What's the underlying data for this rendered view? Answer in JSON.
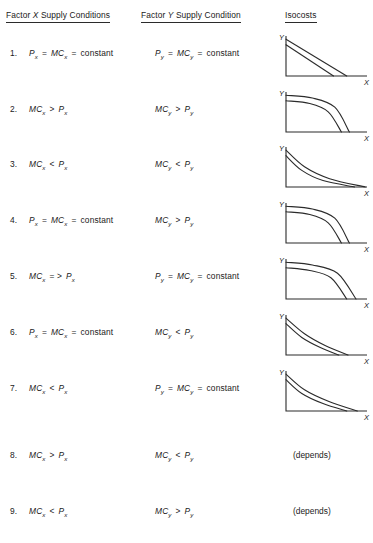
{
  "header": {
    "col_x": {
      "prefix": "Factor ",
      "var": "X",
      "suffix": " Supply Conditions"
    },
    "col_y": {
      "prefix": "Factor ",
      "var": "Y",
      "suffix": " Supply Condition"
    },
    "col_iso": "Isocosts"
  },
  "rows": [
    {
      "num": "1.",
      "x": {
        "lhs_sym": "P",
        "lhs_sub": "x",
        "op1": "=",
        "mid_sym": "MC",
        "mid_sub": "x",
        "op2": "=",
        "rhs": "constant"
      },
      "y": {
        "lhs_sym": "P",
        "lhs_sub": "y",
        "op1": "=",
        "mid_sym": "MC",
        "mid_sub": "y",
        "op2": "=",
        "rhs": "constant"
      },
      "iso": {
        "kind": "chart",
        "shape": "straight",
        "ylabel": "Y",
        "xlabel": "X"
      }
    },
    {
      "num": "2.",
      "x": {
        "lhs_sym": "MC",
        "lhs_sub": "x",
        "op1": ">",
        "mid_sym": "P",
        "mid_sub": "x"
      },
      "y": {
        "lhs_sym": "MC",
        "lhs_sub": "y",
        "op1": ">",
        "mid_sym": "P",
        "mid_sub": "y"
      },
      "iso": {
        "kind": "chart",
        "shape": "concave",
        "ylabel": "Y",
        "xlabel": "X"
      }
    },
    {
      "num": "3.",
      "x": {
        "lhs_sym": "MC",
        "lhs_sub": "x",
        "op1": "<",
        "mid_sym": "P",
        "mid_sub": "x"
      },
      "y": {
        "lhs_sym": "MC",
        "lhs_sub": "y",
        "op1": "<",
        "mid_sym": "P",
        "mid_sub": "y"
      },
      "iso": {
        "kind": "chart",
        "shape": "convex",
        "ylabel": "Y",
        "xlabel": "X"
      }
    },
    {
      "num": "4.",
      "x": {
        "lhs_sym": "P",
        "lhs_sub": "x",
        "op1": "=",
        "mid_sym": "MC",
        "mid_sub": "x",
        "op2": "=",
        "rhs": "constant"
      },
      "y": {
        "lhs_sym": "MC",
        "lhs_sub": "y",
        "op1": ">",
        "mid_sym": "P",
        "mid_sub": "y"
      },
      "iso": {
        "kind": "chart",
        "shape": "concave",
        "ylabel": "Y",
        "xlabel": "X"
      }
    },
    {
      "num": "5.",
      "x": {
        "lhs_sym": "MC",
        "lhs_sub": "x",
        "op1": "= >",
        "mid_sym": "P",
        "mid_sub": "x"
      },
      "y": {
        "lhs_sym": "P",
        "lhs_sub": "y",
        "op1": "=",
        "mid_sym": "MC",
        "mid_sub": "y",
        "op2": "=",
        "rhs": "constant"
      },
      "iso": {
        "kind": "chart",
        "shape": "concave",
        "ylabel": "Y",
        "xlabel": "X"
      }
    },
    {
      "num": "6.",
      "x": {
        "lhs_sym": "P",
        "lhs_sub": "x",
        "op1": "=",
        "mid_sym": "MC",
        "mid_sub": "x",
        "op2": "=",
        "rhs": "constant"
      },
      "y": {
        "lhs_sym": "MC",
        "lhs_sub": "y",
        "op1": "<",
        "mid_sym": "P",
        "mid_sub": "y"
      },
      "iso": {
        "kind": "chart",
        "shape": "convex",
        "ylabel": "Y",
        "xlabel": "X"
      }
    },
    {
      "num": "7.",
      "x": {
        "lhs_sym": "MC",
        "lhs_sub": "x",
        "op1": "<",
        "mid_sym": "P",
        "mid_sub": "x"
      },
      "y": {
        "lhs_sym": "P",
        "lhs_sub": "y",
        "op1": "=",
        "mid_sym": "MC",
        "mid_sub": "y",
        "op2": "=",
        "rhs": "constant"
      },
      "iso": {
        "kind": "chart",
        "shape": "convex",
        "ylabel": "Y",
        "xlabel": "X"
      }
    },
    {
      "num": "8.",
      "x": {
        "lhs_sym": "MC",
        "lhs_sub": "x",
        "op1": ">",
        "mid_sym": "P",
        "mid_sub": "x"
      },
      "y": {
        "lhs_sym": "MC",
        "lhs_sub": "y",
        "op1": "<",
        "mid_sym": "P",
        "mid_sub": "y"
      },
      "iso": {
        "kind": "text",
        "text": "(depends)"
      }
    },
    {
      "num": "9.",
      "x": {
        "lhs_sym": "MC",
        "lhs_sub": "x",
        "op1": "<",
        "mid_sym": "P",
        "mid_sub": "x"
      },
      "y": {
        "lhs_sym": "MC",
        "lhs_sub": "y",
        "op1": ">",
        "mid_sym": "P",
        "mid_sub": "y"
      },
      "iso": {
        "kind": "text",
        "text": "(depends)"
      }
    }
  ],
  "chart_data": {
    "type": "line",
    "title": "Isocosts",
    "xlabel": "X",
    "ylabel": "Y",
    "panels": [
      {
        "row": 1,
        "shape": "straight",
        "curvature": 0,
        "series": [
          {
            "name": "inner isocost",
            "x": [
              0,
              36
            ],
            "y": [
              34,
              0
            ]
          },
          {
            "name": "outer isocost",
            "x": [
              0,
              46
            ],
            "y": [
              40,
              0
            ]
          }
        ]
      },
      {
        "row": 2,
        "shape": "concave",
        "curvature": 1,
        "series": [
          {
            "name": "inner isocost",
            "x": [
              0,
              18,
              32,
              42
            ],
            "y": [
              34,
              31,
              22,
              0
            ]
          },
          {
            "name": "outer isocost",
            "x": [
              0,
              20,
              37,
              48
            ],
            "y": [
              40,
              37,
              27,
              0
            ]
          }
        ]
      },
      {
        "row": 3,
        "shape": "convex",
        "curvature": -1,
        "series": [
          {
            "name": "inner isocost",
            "x": [
              0,
              12,
              28,
              52
            ],
            "y": [
              34,
              18,
              7,
              0
            ]
          },
          {
            "name": "outer isocost",
            "x": [
              0,
              14,
              33,
              60
            ],
            "y": [
              40,
              22,
              9,
              0
            ]
          }
        ]
      },
      {
        "row": 4,
        "shape": "concave",
        "curvature": 1,
        "series": [
          {
            "name": "inner isocost",
            "x": [
              0,
              18,
              32,
              42
            ],
            "y": [
              34,
              31,
              22,
              0
            ]
          },
          {
            "name": "outer isocost",
            "x": [
              0,
              20,
              37,
              48
            ],
            "y": [
              40,
              37,
              27,
              0
            ]
          }
        ]
      },
      {
        "row": 5,
        "shape": "concave",
        "curvature": 1,
        "series": [
          {
            "name": "inner isocost",
            "x": [
              0,
              18,
              34,
              46
            ],
            "y": [
              34,
              31,
              23,
              0
            ]
          },
          {
            "name": "outer isocost",
            "x": [
              0,
              20,
              39,
              53
            ],
            "y": [
              40,
              37,
              28,
              0
            ]
          }
        ]
      },
      {
        "row": 6,
        "shape": "convex",
        "curvature": -1,
        "series": [
          {
            "name": "inner isocost",
            "x": [
              0,
              12,
              26,
              40
            ],
            "y": [
              34,
              19,
              8,
              0
            ]
          },
          {
            "name": "outer isocost",
            "x": [
              0,
              14,
              30,
              47
            ],
            "y": [
              40,
              23,
              10,
              0
            ]
          }
        ]
      },
      {
        "row": 7,
        "shape": "convex",
        "curvature": -1,
        "series": [
          {
            "name": "inner isocost",
            "x": [
              0,
              12,
              28,
              46
            ],
            "y": [
              34,
              19,
              8,
              0
            ]
          },
          {
            "name": "outer isocost",
            "x": [
              0,
              14,
              33,
              54
            ],
            "y": [
              40,
              23,
              10,
              0
            ]
          }
        ]
      }
    ]
  }
}
